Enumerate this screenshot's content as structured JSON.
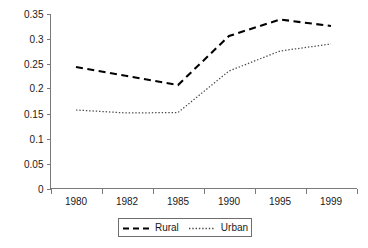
{
  "chart_data": {
    "type": "line",
    "title": "",
    "subtitle": "",
    "xlabel": "",
    "ylabel": "",
    "categories": [
      "1980",
      "1982",
      "1985",
      "1990",
      "1995",
      "1999"
    ],
    "series": [
      {
        "name": "Rural",
        "style": "dashed",
        "color": "#000000",
        "values": [
          0.243,
          0.225,
          0.207,
          0.305,
          0.338,
          0.325
        ]
      },
      {
        "name": "Urban",
        "style": "dotted",
        "color": "#4a4a4a",
        "values": [
          0.157,
          0.151,
          0.152,
          0.235,
          0.275,
          0.289
        ]
      }
    ],
    "ylim": [
      0,
      0.35
    ],
    "yticks": [
      0,
      0.05,
      0.1,
      0.15,
      0.2,
      0.25,
      0.3,
      0.35
    ],
    "ytick_labels": [
      "0",
      "0.05",
      "0.1",
      "0.15",
      "0.2",
      "0.25",
      "0.3",
      "0.35"
    ],
    "grid": false,
    "legend_position": "bottom",
    "legend_entries": [
      "Rural",
      "Urban"
    ]
  },
  "legend": {
    "entries": [
      {
        "label": "Rural"
      },
      {
        "label": "Urban"
      }
    ]
  }
}
